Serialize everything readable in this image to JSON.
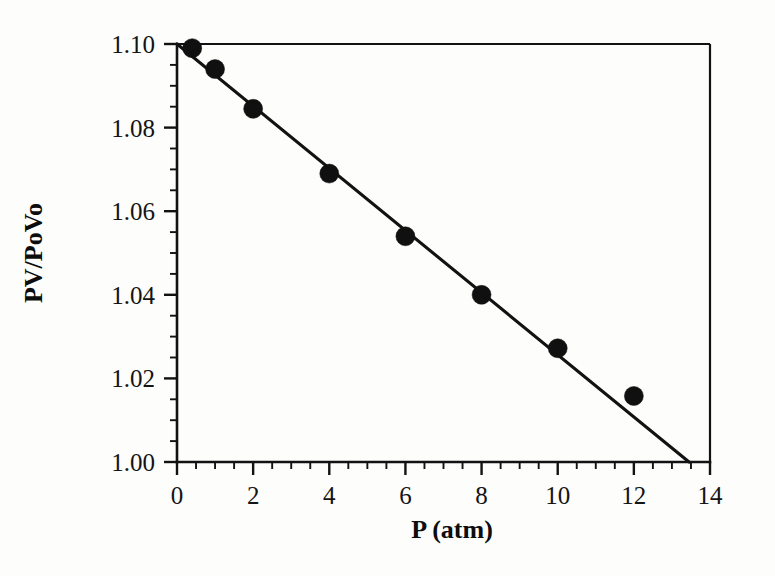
{
  "figure": {
    "background_color": "#fdfdfc",
    "ink_color": "#121212"
  },
  "chart_data": {
    "type": "scatter",
    "title": "",
    "xlabel": "P (atm)",
    "ylabel": "PV/PoVo",
    "xlim": [
      0,
      14
    ],
    "ylim": [
      1.0,
      1.1
    ],
    "grid": false,
    "legend": "none",
    "x_major_ticks": [
      0,
      2,
      4,
      6,
      8,
      10,
      12,
      14
    ],
    "x_tick_labels": [
      "0",
      "2",
      "4",
      "6",
      "8",
      "10",
      "12",
      "14"
    ],
    "x_minor_tick_step": 0.5,
    "y_major_ticks": [
      1.0,
      1.02,
      1.04,
      1.06,
      1.08,
      1.1
    ],
    "y_tick_labels": [
      "1.00",
      "1.02",
      "1.04",
      "1.06",
      "1.08",
      "1.10"
    ],
    "y_minor_tick_step": 0.005,
    "series": [
      {
        "name": "measured",
        "marker": "filled-circle",
        "marker_color": "#101010",
        "points": [
          {
            "x": 0.4,
            "y": 1.099
          },
          {
            "x": 1.0,
            "y": 1.094
          },
          {
            "x": 2.0,
            "y": 1.0845
          },
          {
            "x": 4.0,
            "y": 1.069
          },
          {
            "x": 6.0,
            "y": 1.054
          },
          {
            "x": 8.0,
            "y": 1.04
          },
          {
            "x": 10.0,
            "y": 1.0272
          },
          {
            "x": 12.0,
            "y": 1.0158
          }
        ]
      },
      {
        "name": "linear-fit",
        "marker": "none",
        "line_color": "#121212",
        "endpoints": [
          {
            "x": 0.0,
            "y": 1.1
          },
          {
            "x": 13.45,
            "y": 1.0
          }
        ]
      }
    ]
  },
  "labels": {
    "x_axis_title": "P (atm)",
    "y_axis_title": "PV/PoVo"
  }
}
